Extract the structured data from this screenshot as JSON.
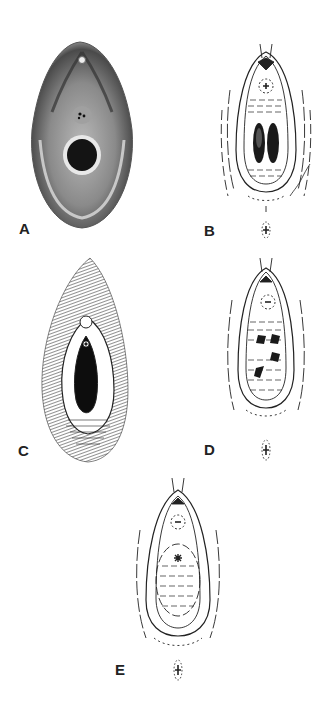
{
  "figure": {
    "panels": [
      {
        "id": "A",
        "label": "A",
        "style": "shaded-photographic-drawing"
      },
      {
        "id": "B",
        "label": "B",
        "style": "line-drawing"
      },
      {
        "id": "C",
        "label": "C",
        "style": "hatched-line-drawing"
      },
      {
        "id": "D",
        "label": "D",
        "style": "line-drawing"
      },
      {
        "id": "E",
        "label": "E",
        "style": "line-drawing"
      }
    ]
  },
  "colors": {
    "ink": "#222222",
    "shade_dark": "#3a3a3a",
    "shade_mid": "#8a8a8a",
    "shade_light": "#c8c8c8",
    "background": "#ffffff"
  }
}
